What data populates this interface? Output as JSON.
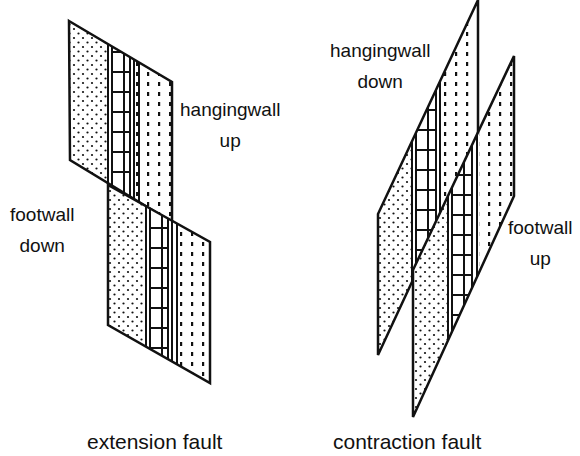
{
  "diagrams": [
    {
      "id": "extension",
      "caption": "extension fault",
      "labels": {
        "hangingwall": [
          "hangingwall",
          "up"
        ],
        "footwall": [
          "footwall",
          "down"
        ]
      }
    },
    {
      "id": "contraction",
      "caption": "contraction fault",
      "labels": {
        "hangingwall": [
          "hangingwall",
          "down"
        ],
        "footwall": [
          "footwall",
          "up"
        ]
      }
    }
  ],
  "legend_patterns": [
    "stippled-sandstone",
    "brick-limestone",
    "dashed-shale"
  ],
  "colors": {
    "ink": "#111111",
    "paper": "#ffffff"
  }
}
